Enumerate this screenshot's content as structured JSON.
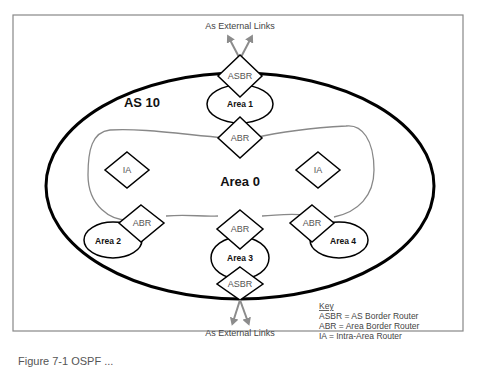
{
  "figure": {
    "autonomous_system_label": "AS 10",
    "backbone_label": "Area 0",
    "external_links_top": "As External Links",
    "external_links_bottom": "As External Links",
    "areas": {
      "area1": "Area 1",
      "area2": "Area 2",
      "area3": "Area 3",
      "area4": "Area 4"
    },
    "routers": {
      "asbr_top": "ASBR",
      "abr_area1": "ABR",
      "ia_left": "IA",
      "ia_right": "IA",
      "abr_area2": "ABR",
      "abr_area3": "ABR",
      "abr_area4": "ABR",
      "asbr_bottom": "ASBR"
    },
    "key": {
      "title": "Key",
      "items": [
        "ASBR = AS Border Router",
        "ABR = Area Border Router",
        "IA = Intra-Area Router"
      ]
    },
    "colors": {
      "frame": "#808080",
      "as_boundary": "#000000",
      "area0_boundary": "#888888",
      "arrow": "#8c8c8c"
    }
  },
  "caption": "Figure 7-1  OSPF ..."
}
